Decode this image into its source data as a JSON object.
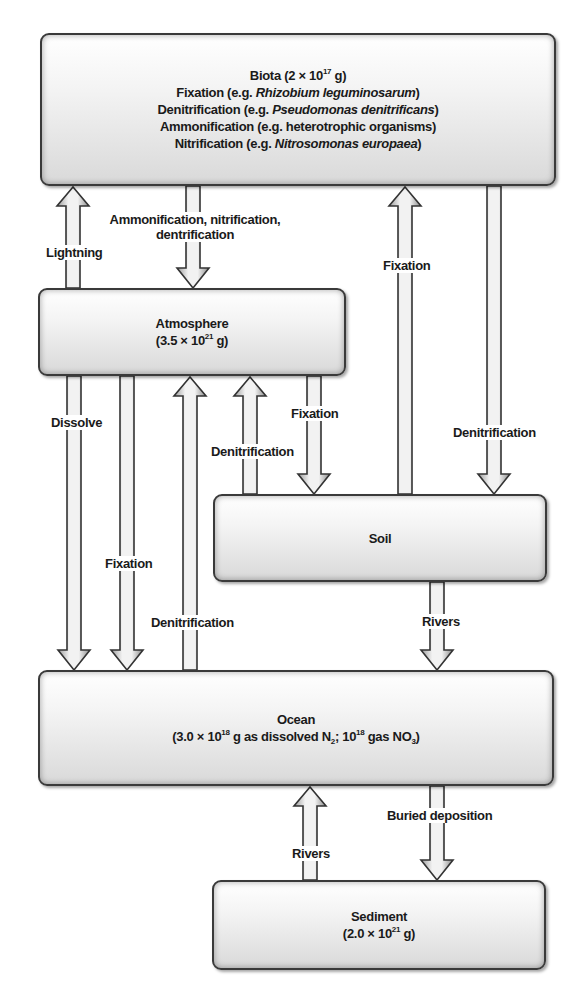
{
  "diagram": {
    "type": "nitrogen-cycle-reservoir-flow",
    "colors": {
      "box_fill_top": "#ffffff",
      "box_fill_bottom": "#d9d9d9",
      "box_border": "#3a3a3a",
      "arrow_fill": "#e6e6e6",
      "arrow_stroke": "#333333",
      "text": "#1a1a1a"
    },
    "boxes": {
      "biota": {
        "title": "Biota (2 × 10",
        "title_sup": "17",
        "title_end": " g)",
        "lines": [
          {
            "prefix": "Fixation (e.g. ",
            "italic": "Rhizobium leguminosarum",
            "suffix": ")"
          },
          {
            "prefix": "Denitrification (e.g. ",
            "italic": "Pseudomonas denitrificans",
            "suffix": ")"
          },
          {
            "prefix": "Ammonification (e.g. heterotrophic organisms)",
            "italic": "",
            "suffix": ""
          },
          {
            "prefix": "Nitrification (e.g. ",
            "italic": "Nitrosomonas europaea",
            "suffix": ")"
          }
        ]
      },
      "atmosphere": {
        "name": "Atmosphere",
        "mass_prefix": "(3.5 × 10",
        "mass_sup": "21",
        "mass_suffix": " g)"
      },
      "soil": {
        "name": "Soil"
      },
      "ocean": {
        "name": "Ocean",
        "mass_prefix": "(3.0 × 10",
        "mass_sup": "18",
        "mass_mid1": " g as dissolved N",
        "mass_sub1": "2",
        "mass_mid2": "; 10",
        "mass_sup2": "18",
        "mass_mid3": " gas NO",
        "mass_sub2": "3",
        "mass_suffix": ")"
      },
      "sediment": {
        "name": "Sediment",
        "mass_prefix": "(2.0 × 10",
        "mass_sup": "21",
        "mass_suffix": " g)"
      }
    },
    "flows": [
      {
        "from": "atmosphere",
        "to": "biota",
        "label": "Lightning"
      },
      {
        "from": "biota",
        "to": "atmosphere",
        "label": "Ammonification, nitrification, dentrification",
        "label_lines": [
          "Ammonification, nitrification,",
          "dentrification"
        ]
      },
      {
        "from": "soil",
        "to": "biota",
        "label": "Fixation"
      },
      {
        "from": "biota",
        "to": "soil",
        "label": "Denitrification"
      },
      {
        "from": "atmosphere",
        "to": "ocean",
        "label": "Dissolve"
      },
      {
        "from": "atmosphere",
        "to": "ocean",
        "label": "Fixation"
      },
      {
        "from": "ocean",
        "to": "atmosphere",
        "label": "Denitrification"
      },
      {
        "from": "soil",
        "to": "atmosphere",
        "label": "Denitrification"
      },
      {
        "from": "atmosphere",
        "to": "soil",
        "label": "Fixation"
      },
      {
        "from": "soil",
        "to": "ocean",
        "label": "Rivers"
      },
      {
        "from": "sediment",
        "to": "ocean",
        "label": "Rivers"
      },
      {
        "from": "ocean",
        "to": "sediment",
        "label": "Buried deposition"
      }
    ]
  }
}
